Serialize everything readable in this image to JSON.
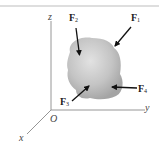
{
  "figure": {
    "axes": {
      "x": "x",
      "y": "y",
      "z": "z",
      "origin": "O"
    },
    "forces": [
      {
        "id": "F1",
        "symbol": "F",
        "subscript": "1"
      },
      {
        "id": "F2",
        "symbol": "F",
        "subscript": "2"
      },
      {
        "id": "F3",
        "symbol": "F",
        "subscript": "3"
      },
      {
        "id": "F4",
        "symbol": "F",
        "subscript": "4"
      }
    ],
    "colors": {
      "body_light": "#d6d6d6",
      "body_dark": "#a8a8a8",
      "axis": "#8a8a8a",
      "arrow": "#111111",
      "top_rule": "#bdbdbd"
    }
  }
}
